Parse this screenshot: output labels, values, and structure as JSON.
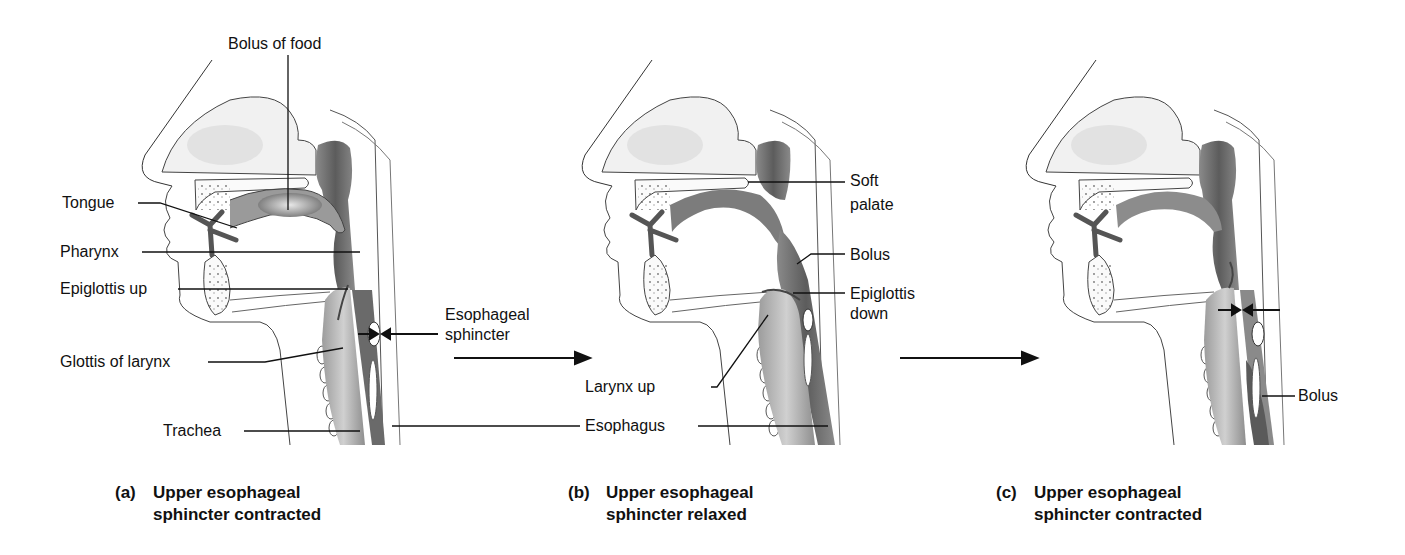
{
  "figure": {
    "panels": [
      {
        "id": "a",
        "caption_letter": "(a)",
        "caption_line1": "Upper esophageal",
        "caption_line2": "sphincter contracted",
        "labels": {
          "bolus_of_food": "Bolus of food",
          "tongue": "Tongue",
          "pharynx": "Pharynx",
          "epiglottis_up": "Epiglottis up",
          "glottis_of_larynx": "Glottis of larynx",
          "trachea": "Trachea"
        }
      },
      {
        "id": "b",
        "caption_letter": "(b)",
        "caption_line1": "Upper esophageal",
        "caption_line2": "sphincter relaxed",
        "labels": {
          "soft_palate_1": "Soft",
          "soft_palate_2": "palate",
          "bolus": "Bolus",
          "epiglottis_down_1": "Epiglottis",
          "epiglottis_down_2": "down",
          "larynx_up": "Larynx up"
        }
      },
      {
        "id": "c",
        "caption_letter": "(c)",
        "caption_line1": "Upper esophageal",
        "caption_line2": "sphincter contracted",
        "labels": {
          "bolus": "Bolus"
        }
      }
    ],
    "shared_labels": {
      "esophageal_sphincter_1": "Esophageal",
      "esophageal_sphincter_2": "sphincter",
      "esophagus": "Esophagus"
    },
    "colors": {
      "background": "#ffffff",
      "line": "#111111",
      "tissue_dark": "#6f6f6f",
      "tissue_mid": "#a8a8a8",
      "tissue_light": "#e6e6e6"
    }
  }
}
